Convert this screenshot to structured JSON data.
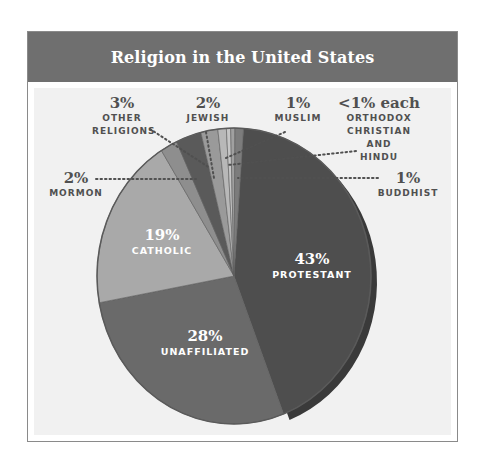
{
  "title": "Religion in the United States",
  "colors": {
    "header_bg": "#6f6f6f",
    "panel_bg": "#f1f1f1",
    "protestant": "#4e4e4e",
    "protestant_edge": "#3a3a3a",
    "unaffiliated": "#6a6a6a",
    "catholic": "#a9a9a9",
    "mormon": "#8e8e8e",
    "other": "#5a5a5a",
    "jewish": "#9a9a9a",
    "muslim": "#b8b8b8",
    "orthodox": "#c6c6c6",
    "hindu": "#a0a0a0",
    "buddhist": "#7c7c7c",
    "label_text": "#505050"
  },
  "labels": {
    "other": {
      "pct": "3%",
      "name1": "OTHER",
      "name2": "RELIGIONS"
    },
    "jewish": {
      "pct": "2%",
      "name": "JEWISH"
    },
    "muslim": {
      "pct": "1%",
      "name": "MUSLIM"
    },
    "orthodox_hindu": {
      "pct": "<1% each",
      "name1": "ORTHODOX",
      "name2": "CHRISTIAN AND",
      "name3": "HINDU"
    },
    "mormon": {
      "pct": "2%",
      "name": "MORMON"
    },
    "buddhist": {
      "pct": "1%",
      "name": "BUDDHIST"
    },
    "catholic": {
      "pct": "19%",
      "name": "CATHOLIC"
    },
    "protestant": {
      "pct": "43%",
      "name": "PROTESTANT"
    },
    "unaffiliated": {
      "pct": "28%",
      "name": "UNAFFILIATED"
    }
  },
  "chart_data": {
    "type": "pie",
    "title": "Religion in the United States",
    "categories": [
      "Protestant",
      "Unaffiliated",
      "Catholic",
      "Mormon",
      "Other Religions",
      "Jewish",
      "Muslim",
      "Orthodox Christian",
      "Hindu",
      "Buddhist"
    ],
    "values": [
      43,
      28,
      19,
      2,
      3,
      2,
      1,
      0.5,
      0.5,
      1
    ],
    "value_labels": [
      "43%",
      "28%",
      "19%",
      "2%",
      "3%",
      "2%",
      "1%",
      "<1%",
      "<1%",
      "1%"
    ],
    "legend": "none (direct labels with dotted leader lines)"
  }
}
